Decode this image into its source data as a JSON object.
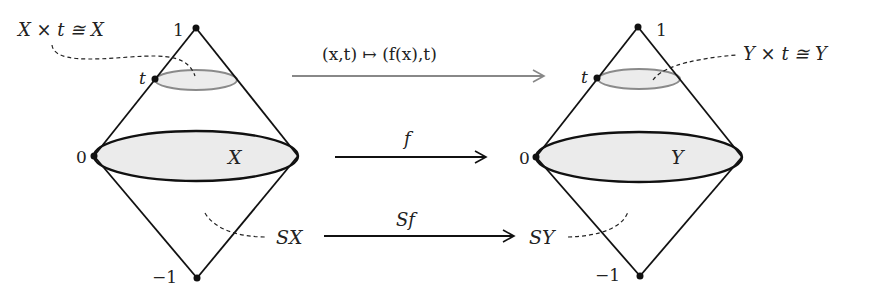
{
  "diagram": {
    "left_cone": {
      "label_top": "1",
      "label_t": "t",
      "label_zero": "0",
      "label_bottom": "−1",
      "base_label": "X",
      "slice_annotation": "X × t ≅ X",
      "suspension_label": "SX"
    },
    "right_cone": {
      "label_top": "1",
      "label_t": "t",
      "label_zero": "0",
      "label_bottom": "−1",
      "base_label": "Y",
      "slice_annotation": "Y × t ≅ Y",
      "suspension_label": "SY"
    },
    "arrows": {
      "top": {
        "label": "(x,t) ↦ (f(x),t)",
        "color": "#888888"
      },
      "middle": {
        "label": "f",
        "color": "#111111"
      },
      "bottom": {
        "label": "Sf",
        "color": "#111111"
      }
    },
    "colors": {
      "line": "#111111",
      "fill": "#ebebeb",
      "slice_stroke": "#8a8a8a"
    }
  }
}
